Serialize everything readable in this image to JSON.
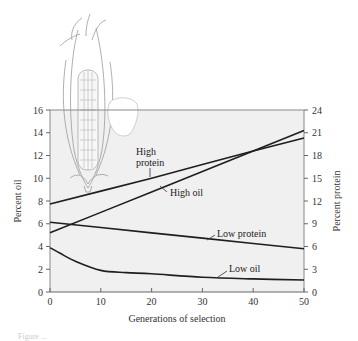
{
  "chart_data": {
    "type": "line",
    "title": "",
    "xlabel": "Generations of selection",
    "ylabel_left": "Percent oil",
    "ylabel_right": "Percent protein",
    "xlim": [
      0,
      50
    ],
    "ylim_left": [
      0,
      16
    ],
    "ylim_right": [
      0,
      24
    ],
    "x_ticks": [
      0,
      10,
      20,
      30,
      40,
      50
    ],
    "y_ticks_left": [
      0,
      2,
      4,
      6,
      8,
      10,
      12,
      14,
      16
    ],
    "y_ticks_right": [
      0,
      3,
      6,
      9,
      12,
      15,
      18,
      21,
      24
    ],
    "grid": false,
    "legend": "inline labels with leader lines",
    "series": [
      {
        "name": "High protein",
        "axis": "right",
        "x": [
          0,
          10,
          20,
          30,
          40,
          50
        ],
        "values": [
          11.6,
          13.3,
          15.0,
          16.8,
          18.6,
          20.3
        ]
      },
      {
        "name": "High oil",
        "axis": "left",
        "x": [
          0,
          10,
          20,
          30,
          40,
          50
        ],
        "values": [
          5.2,
          7.0,
          8.8,
          10.6,
          12.4,
          14.2
        ]
      },
      {
        "name": "Low protein",
        "axis": "right",
        "x": [
          0,
          10,
          20,
          30,
          40,
          50
        ],
        "values": [
          9.2,
          8.5,
          7.8,
          7.1,
          6.4,
          5.7
        ]
      },
      {
        "name": "Low oil",
        "axis": "left",
        "x": [
          0,
          2,
          5,
          10,
          15,
          20,
          30,
          40,
          50
        ],
        "values": [
          3.9,
          3.4,
          2.7,
          1.9,
          1.7,
          1.6,
          1.3,
          1.15,
          1.05
        ]
      }
    ],
    "annotations": [
      "High protein",
      "High oil",
      "Low protein",
      "Low oil"
    ],
    "illustrations": [
      "corn-ear",
      "corn-kernel"
    ]
  },
  "caption_partial": "Figure ..."
}
